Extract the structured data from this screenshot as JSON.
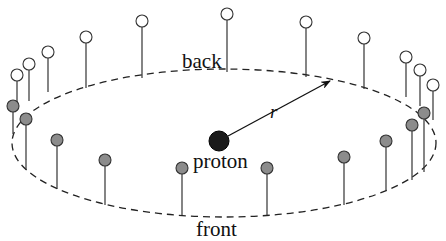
{
  "diagram": {
    "title": "",
    "labels": {
      "back": "back",
      "front": "front",
      "proton": "proton",
      "radius": "r"
    },
    "colors": {
      "line": "#333333",
      "open_circle_fill": "#ffffff",
      "filled_circle_fill": "#8c8c8c",
      "proton_fill": "#1a1a1a",
      "background": "#ffffff"
    },
    "ring": {
      "cx": 224,
      "cy": 143,
      "rx": 212,
      "ry": 74,
      "style": "dashed"
    },
    "proton": {
      "cx": 219,
      "cy": 141,
      "r": 10
    },
    "radius_arrow": {
      "x1": 228,
      "y1": 136,
      "x2": 330,
      "y2": 81
    },
    "open_markers": [
      {
        "cx": 17,
        "cy": 75,
        "base_y": 108
      },
      {
        "cx": 29,
        "cy": 64,
        "base_y": 101
      },
      {
        "cx": 48,
        "cy": 52,
        "base_y": 92
      },
      {
        "cx": 86,
        "cy": 37,
        "base_y": 88
      },
      {
        "cx": 142,
        "cy": 21,
        "base_y": 78
      },
      {
        "cx": 227,
        "cy": 14,
        "base_y": 72
      },
      {
        "cx": 306,
        "cy": 22,
        "base_y": 77
      },
      {
        "cx": 364,
        "cy": 38,
        "base_y": 89
      },
      {
        "cx": 406,
        "cy": 57,
        "base_y": 97
      },
      {
        "cx": 420,
        "cy": 70,
        "base_y": 106
      },
      {
        "cx": 433,
        "cy": 85,
        "base_y": 120
      }
    ],
    "filled_markers": [
      {
        "cx": 13,
        "cy": 106,
        "base_y": 134
      },
      {
        "cx": 26,
        "cy": 119,
        "base_y": 170
      },
      {
        "cx": 57,
        "cy": 140,
        "base_y": 189
      },
      {
        "cx": 105,
        "cy": 160,
        "base_y": 205
      },
      {
        "cx": 182,
        "cy": 168,
        "base_y": 215
      },
      {
        "cx": 267,
        "cy": 168,
        "base_y": 215
      },
      {
        "cx": 344,
        "cy": 157,
        "base_y": 205
      },
      {
        "cx": 386,
        "cy": 141,
        "base_y": 191
      },
      {
        "cx": 412,
        "cy": 125,
        "base_y": 180
      },
      {
        "cx": 424,
        "cy": 113,
        "base_y": 172
      }
    ]
  }
}
